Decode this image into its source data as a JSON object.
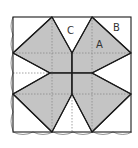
{
  "figure": {
    "type": "quilt-block-diagram",
    "labels": [
      {
        "id": "A",
        "text": "A",
        "x": 99,
        "y": 48
      },
      {
        "id": "B",
        "text": "B",
        "x": 113,
        "y": 31
      },
      {
        "id": "C",
        "text": "C",
        "x": 67,
        "y": 34
      }
    ],
    "colors": {
      "fill": "#c4c4c4",
      "stroke": "#1a1a1a",
      "dotted": "#8a8a8a",
      "background": "#ffffff"
    }
  }
}
